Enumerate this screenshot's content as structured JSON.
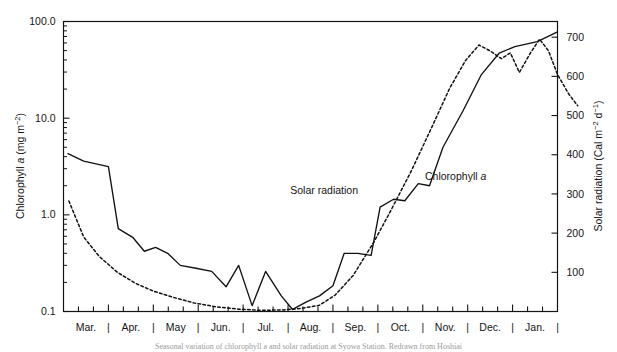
{
  "figure": {
    "caption_fragment": "Seasonal variation of chlorophyll a and solar radiation at Syowa Station. Redrawn from Hoshiai"
  },
  "chart_data": {
    "type": "line",
    "title": "",
    "xlabel": "",
    "grid": false,
    "legend_position": "inline-annotations",
    "categories": [
      "Mar.",
      "Apr.",
      "May",
      "Jun.",
      "Jul.",
      "Aug.",
      "Sep.",
      "Oct.",
      "Nov.",
      "Dec.",
      "Jan."
    ],
    "x_separator": "|",
    "x_axis": {
      "range_months": [
        0,
        11
      ],
      "ticks_per_month": 2
    },
    "axes": {
      "left": {
        "label_text": "Chlorophyll a (mg m",
        "label_exponent": "-2",
        "label_suffix": ")",
        "scale": "log",
        "ylim": [
          0.1,
          100.0
        ],
        "tick_labels": [
          "100.0",
          "10.0",
          "1.0",
          "0.1"
        ],
        "tick_values": [
          100.0,
          10.0,
          1.0,
          0.1
        ]
      },
      "right": {
        "label_text": "Solar radiation (Cal m",
        "label_exponent": "-2",
        "label_mid": " d",
        "label_exponent2": "-1",
        "label_suffix": ")",
        "scale": "linear",
        "ylim": [
          0,
          740
        ],
        "tick_labels": [
          "700",
          "600",
          "500",
          "400",
          "300",
          "200",
          "100"
        ],
        "tick_values": [
          700,
          600,
          500,
          400,
          300,
          200,
          100
        ]
      }
    },
    "series": [
      {
        "name": "Chlorophyll a",
        "axis": "left",
        "style": "solid",
        "annotation": {
          "text": "Chlorophyll ",
          "italic": "a",
          "x_month": 8.05,
          "y_value": 2.3
        },
        "points": [
          [
            0.1,
            4.3
          ],
          [
            0.45,
            3.6
          ],
          [
            0.8,
            3.3
          ],
          [
            1.0,
            3.15
          ],
          [
            1.22,
            0.72
          ],
          [
            1.55,
            0.58
          ],
          [
            1.8,
            0.42
          ],
          [
            2.05,
            0.46
          ],
          [
            2.32,
            0.4
          ],
          [
            2.6,
            0.3
          ],
          [
            2.95,
            0.28
          ],
          [
            3.3,
            0.26
          ],
          [
            3.62,
            0.18
          ],
          [
            3.9,
            0.3
          ],
          [
            4.2,
            0.115
          ],
          [
            4.5,
            0.26
          ],
          [
            4.85,
            0.145
          ],
          [
            5.1,
            0.105
          ],
          [
            5.4,
            0.125
          ],
          [
            5.7,
            0.145
          ],
          [
            6.0,
            0.185
          ],
          [
            6.25,
            0.4
          ],
          [
            6.55,
            0.4
          ],
          [
            6.85,
            0.38
          ],
          [
            7.05,
            1.2
          ],
          [
            7.35,
            1.45
          ],
          [
            7.6,
            1.4
          ],
          [
            7.9,
            2.1
          ],
          [
            8.15,
            2.0
          ],
          [
            8.45,
            5.0
          ],
          [
            8.9,
            12.0
          ],
          [
            9.3,
            28.0
          ],
          [
            9.7,
            47.0
          ],
          [
            10.05,
            55.0
          ],
          [
            10.55,
            62.0
          ],
          [
            11.0,
            78.0
          ]
        ]
      },
      {
        "name": "Solar radiation",
        "axis": "right",
        "style": "dotted",
        "annotation": {
          "text": "Solar radiation",
          "x_month": 5.05,
          "y_value": 300
        },
        "points": [
          [
            0.12,
            282
          ],
          [
            0.45,
            190
          ],
          [
            0.8,
            140
          ],
          [
            1.2,
            100
          ],
          [
            1.6,
            72
          ],
          [
            2.0,
            52
          ],
          [
            2.45,
            36
          ],
          [
            2.9,
            22
          ],
          [
            3.4,
            12
          ],
          [
            3.9,
            6
          ],
          [
            4.4,
            3
          ],
          [
            4.9,
            4
          ],
          [
            5.3,
            8
          ],
          [
            5.7,
            16
          ],
          [
            6.05,
            42
          ],
          [
            6.45,
            92
          ],
          [
            6.9,
            175
          ],
          [
            7.3,
            260
          ],
          [
            7.75,
            360
          ],
          [
            8.2,
            470
          ],
          [
            8.6,
            570
          ],
          [
            8.95,
            640
          ],
          [
            9.25,
            680
          ],
          [
            9.5,
            665
          ],
          [
            9.75,
            645
          ],
          [
            9.95,
            660
          ],
          [
            10.15,
            610
          ],
          [
            10.4,
            660
          ],
          [
            10.6,
            695
          ],
          [
            10.8,
            665
          ],
          [
            11.0,
            605
          ],
          [
            11.25,
            555
          ],
          [
            11.45,
            525
          ]
        ]
      }
    ]
  }
}
